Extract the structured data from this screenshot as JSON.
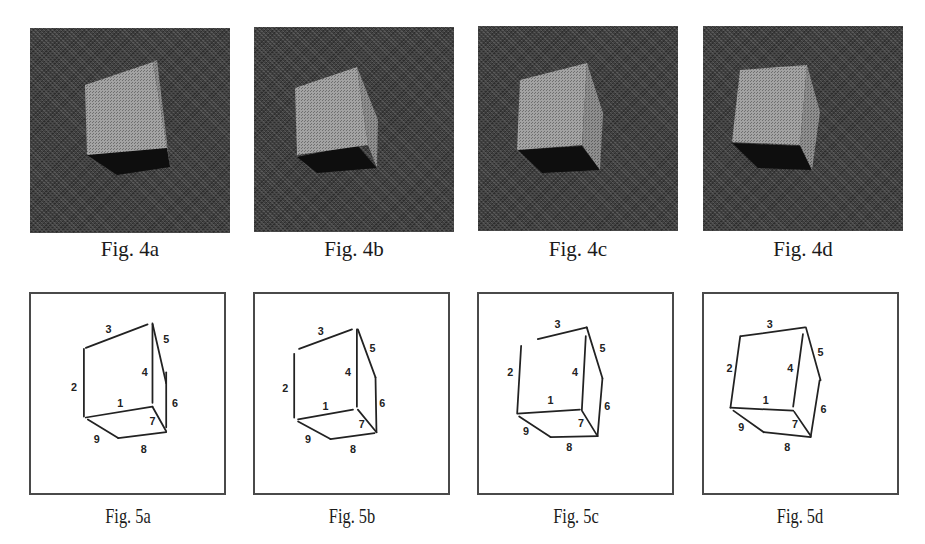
{
  "colors": {
    "photo_background": "#3b3b3b",
    "cube_face": "#a3a3a3",
    "cube_side": "#8e8e8e",
    "cube_shadow": "#0e0e0e",
    "line": "#222222",
    "frame": "#4a4a4a"
  },
  "photos": [
    {
      "caption": "Fig. 4a",
      "x": 30,
      "y": 28,
      "front": [
        [
          55,
          57
        ],
        [
          123,
          34
        ],
        [
          137,
          120
        ],
        [
          57,
          127
        ]
      ],
      "side": [
        [
          123,
          34
        ],
        [
          127,
          32
        ],
        [
          140,
          139
        ],
        [
          137,
          120
        ]
      ],
      "shadow": [
        [
          57,
          127
        ],
        [
          137,
          115
        ],
        [
          140,
          139
        ],
        [
          87,
          147
        ]
      ]
    },
    {
      "caption": "Fig. 4b",
      "x": 254,
      "y": 27,
      "front": [
        [
          41,
          61
        ],
        [
          103,
          40
        ],
        [
          114,
          118
        ],
        [
          43,
          128
        ]
      ],
      "side": [
        [
          103,
          40
        ],
        [
          124,
          93
        ],
        [
          123,
          141
        ],
        [
          114,
          118
        ]
      ],
      "shadow": [
        [
          43,
          130
        ],
        [
          103,
          118
        ],
        [
          123,
          141
        ],
        [
          63,
          146
        ]
      ]
    },
    {
      "caption": "Fig. 4c",
      "x": 478,
      "y": 26,
      "front": [
        [
          42,
          54
        ],
        [
          109,
          37
        ],
        [
          104,
          119
        ],
        [
          39,
          124
        ]
      ],
      "side": [
        [
          109,
          37
        ],
        [
          125,
          87
        ],
        [
          122,
          144
        ],
        [
          104,
          119
        ]
      ],
      "shadow": [
        [
          40,
          124
        ],
        [
          104,
          120
        ],
        [
          122,
          144
        ],
        [
          64,
          147
        ]
      ]
    },
    {
      "caption": "Fig. 4d",
      "x": 703,
      "y": 26,
      "front": [
        [
          37,
          44
        ],
        [
          104,
          39
        ],
        [
          97,
          119
        ],
        [
          29,
          116
        ]
      ],
      "side": [
        [
          104,
          39
        ],
        [
          117,
          86
        ],
        [
          109,
          144
        ],
        [
          97,
          119
        ]
      ],
      "shadow": [
        [
          29,
          117
        ],
        [
          97,
          120
        ],
        [
          109,
          144
        ],
        [
          55,
          142
        ]
      ]
    }
  ],
  "linearts": [
    {
      "caption": "Fig. 5a",
      "x": 29,
      "y": 292,
      "edges": [
        {
          "id": "1",
          "p": [
            [
              56,
              126
            ],
            [
              124,
              115
            ]
          ]
        },
        {
          "id": "2",
          "p": [
            [
              54,
              56
            ],
            [
              54,
              125
            ]
          ]
        },
        {
          "id": "3",
          "p": [
            [
              56,
              55
            ],
            [
              119,
              31
            ]
          ]
        },
        {
          "id": "4",
          "p": [
            [
              124,
              31
            ],
            [
              124,
              111
            ]
          ]
        },
        {
          "id": "5",
          "p": [
            [
              124,
              30
            ],
            [
              138,
              91
            ]
          ]
        },
        {
          "id": "6",
          "p": [
            [
              138,
              80
            ],
            [
              138,
              136
            ]
          ]
        },
        {
          "id": "7",
          "p": [
            [
              124,
              115
            ],
            [
              138,
              140
            ]
          ]
        },
        {
          "id": "8",
          "p": [
            [
              89,
              147
            ],
            [
              138,
              141
            ]
          ]
        },
        {
          "id": "9",
          "p": [
            [
              58,
              128
            ],
            [
              89,
              147
            ]
          ]
        }
      ],
      "labels": [
        {
          "t": "3",
          "x": 79,
          "y": 40
        },
        {
          "t": "5",
          "x": 138,
          "y": 50
        },
        {
          "t": "4",
          "x": 116,
          "y": 84
        },
        {
          "t": "2",
          "x": 44,
          "y": 99
        },
        {
          "t": "1",
          "x": 91,
          "y": 115
        },
        {
          "t": "6",
          "x": 147,
          "y": 115
        },
        {
          "t": "7",
          "x": 124,
          "y": 134
        },
        {
          "t": "9",
          "x": 67,
          "y": 152
        },
        {
          "t": "8",
          "x": 115,
          "y": 162
        }
      ]
    },
    {
      "caption": "Fig. 5b",
      "x": 253,
      "y": 292,
      "edges": [
        {
          "id": "1",
          "p": [
            [
              44,
              128
            ],
            [
              100,
              118
            ]
          ]
        },
        {
          "id": "2",
          "p": [
            [
              40,
              61
            ],
            [
              40,
              126
            ]
          ]
        },
        {
          "id": "3",
          "p": [
            [
              45,
              56
            ],
            [
              99,
              36
            ]
          ]
        },
        {
          "id": "4",
          "p": [
            [
              104,
              36
            ],
            [
              104,
              115
            ]
          ]
        },
        {
          "id": "5",
          "p": [
            [
              105,
              36
            ],
            [
              123,
              85
            ]
          ]
        },
        {
          "id": "6",
          "p": [
            [
              123,
              85
            ],
            [
              124,
              141
            ]
          ]
        },
        {
          "id": "7",
          "p": [
            [
              105,
              118
            ],
            [
              124,
              141
            ]
          ]
        },
        {
          "id": "8",
          "p": [
            [
              77,
              148
            ],
            [
              122,
              142
            ]
          ]
        },
        {
          "id": "9",
          "p": [
            [
              44,
              130
            ],
            [
              77,
              148
            ]
          ]
        }
      ],
      "labels": [
        {
          "t": "3",
          "x": 67,
          "y": 42
        },
        {
          "t": "5",
          "x": 120,
          "y": 59
        },
        {
          "t": "4",
          "x": 95,
          "y": 84
        },
        {
          "t": "2",
          "x": 31,
          "y": 100
        },
        {
          "t": "1",
          "x": 72,
          "y": 118
        },
        {
          "t": "6",
          "x": 130,
          "y": 115
        },
        {
          "t": "7",
          "x": 109,
          "y": 137
        },
        {
          "t": "9",
          "x": 54,
          "y": 152
        },
        {
          "t": "8",
          "x": 100,
          "y": 162
        }
      ]
    },
    {
      "caption": "Fig. 5c",
      "x": 477,
      "y": 292,
      "edges": [
        {
          "id": "1",
          "p": [
            [
              39,
              122
            ],
            [
              103,
              118
            ]
          ]
        },
        {
          "id": "2",
          "p": [
            [
              43,
              53
            ],
            [
              39,
              121
            ]
          ]
        },
        {
          "id": "3",
          "p": [
            [
              60,
              46
            ],
            [
              110,
              34
            ]
          ]
        },
        {
          "id": "4",
          "p": [
            [
              109,
              43
            ],
            [
              105,
              118
            ]
          ]
        },
        {
          "id": "5",
          "p": [
            [
              110,
              34
            ],
            [
              126,
              86
            ]
          ]
        },
        {
          "id": "6",
          "p": [
            [
              126,
              86
            ],
            [
              121,
              145
            ]
          ]
        },
        {
          "id": "7",
          "p": [
            [
              105,
              119
            ],
            [
              121,
              145
            ]
          ]
        },
        {
          "id": "8",
          "p": [
            [
              73,
              146
            ],
            [
              121,
              145
            ]
          ]
        },
        {
          "id": "9",
          "p": [
            [
              41,
              125
            ],
            [
              73,
              146
            ]
          ]
        }
      ],
      "labels": [
        {
          "t": "3",
          "x": 80,
          "y": 35
        },
        {
          "t": "5",
          "x": 126,
          "y": 59
        },
        {
          "t": "4",
          "x": 98,
          "y": 84
        },
        {
          "t": "2",
          "x": 32,
          "y": 84
        },
        {
          "t": "1",
          "x": 73,
          "y": 112
        },
        {
          "t": "6",
          "x": 131,
          "y": 118
        },
        {
          "t": "7",
          "x": 104,
          "y": 136
        },
        {
          "t": "9",
          "x": 48,
          "y": 144
        },
        {
          "t": "8",
          "x": 92,
          "y": 160
        }
      ]
    },
    {
      "caption": "Fig. 5d",
      "x": 702,
      "y": 292,
      "edges": [
        {
          "id": "1",
          "p": [
            [
              27,
              116
            ],
            [
              91,
              119
            ]
          ]
        },
        {
          "id": "2",
          "p": [
            [
              37,
              43
            ],
            [
              27,
              116
            ]
          ]
        },
        {
          "id": "3",
          "p": [
            [
              38,
              43
            ],
            [
              103,
              34
            ]
          ]
        },
        {
          "id": "4",
          "p": [
            [
              101,
              41
            ],
            [
              91,
              115
            ]
          ]
        },
        {
          "id": "5",
          "p": [
            [
              104,
              34
            ],
            [
              119,
              88
            ]
          ]
        },
        {
          "id": "6",
          "p": [
            [
              118,
              88
            ],
            [
              109,
              145
            ]
          ]
        },
        {
          "id": "7",
          "p": [
            [
              92,
              120
            ],
            [
              109,
              145
            ]
          ]
        },
        {
          "id": "8",
          "p": [
            [
              61,
              141
            ],
            [
              109,
              146
            ]
          ]
        },
        {
          "id": "9",
          "p": [
            [
              30,
              119
            ],
            [
              61,
              141
            ]
          ]
        }
      ],
      "labels": [
        {
          "t": "3",
          "x": 67,
          "y": 35
        },
        {
          "t": "5",
          "x": 119,
          "y": 63
        },
        {
          "t": "4",
          "x": 88,
          "y": 80
        },
        {
          "t": "2",
          "x": 26,
          "y": 80
        },
        {
          "t": "1",
          "x": 63,
          "y": 112
        },
        {
          "t": "6",
          "x": 122,
          "y": 121
        },
        {
          "t": "7",
          "x": 93,
          "y": 137
        },
        {
          "t": "9",
          "x": 38,
          "y": 140
        },
        {
          "t": "8",
          "x": 85,
          "y": 160
        }
      ]
    }
  ]
}
